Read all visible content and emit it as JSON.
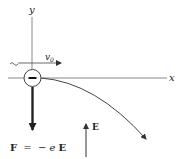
{
  "diagram": {
    "axes": {
      "x_label": "x",
      "y_label": "y"
    },
    "velocity_label": "v",
    "velocity_subscript": "0",
    "particle_charge_symbol": "−",
    "force_label": "F = −e E",
    "force_label_parts": {
      "F": "F",
      "eq": "=",
      "minus": "−",
      "e": "e",
      "E": "E"
    },
    "field_label": "E",
    "colors": {
      "stroke": "#333333",
      "axis": "#888888",
      "background": "#ffffff"
    }
  }
}
